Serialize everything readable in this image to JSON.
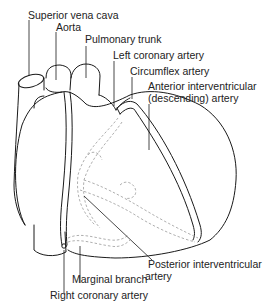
{
  "diagram": {
    "line_color": "#1a1a1a",
    "dashed_color": "#9a9a9a",
    "labels": {
      "superior_vena_cava": "Superior vena cava",
      "aorta": "Aorta",
      "pulmonary_trunk": "Pulmonary trunk",
      "left_coronary_artery": "Left coronary artery",
      "circumflex_artery": "Circumflex artery",
      "anterior_interventricular_line1": "Anterior interventricular",
      "anterior_interventricular_line2": "(descending) artery",
      "posterior_interventricular_line1": "Posterior interventricular",
      "posterior_interventricular_line2": "artery",
      "marginal_branch": "Marginal branch",
      "right_coronary_artery": "Right coronary artery"
    }
  }
}
